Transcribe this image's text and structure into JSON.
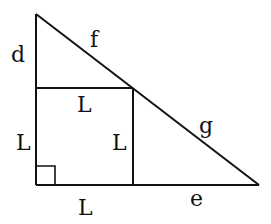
{
  "diagram": {
    "labels": {
      "d": "d",
      "f": "f",
      "g": "g",
      "e": "e",
      "square_top": "L",
      "square_left": "L",
      "square_right": "L",
      "square_bottom": "L"
    },
    "colors": {
      "line": "#111111",
      "background": "#ffffff"
    }
  }
}
